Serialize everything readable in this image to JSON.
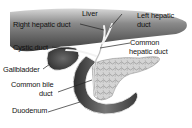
{
  "diagram": {
    "labels": {
      "liver": "Liver",
      "right_hepatic_duct": "Right hepatic duct",
      "left_hepatic_duct_line1": "Left hepatic",
      "left_hepatic_duct_line2": "duct",
      "cystic_duct": "Cystic duct",
      "common_hepatic_duct_line1": "Common",
      "common_hepatic_duct_line2": "hepatic duct",
      "gallbladder": "Gallbladder",
      "common_bile_duct_line1": "Common bile",
      "common_bile_duct_line2": "duct",
      "duodenum": "Duodenum"
    },
    "structures": [
      "liver",
      "gallbladder",
      "duodenum",
      "pancreas",
      "hepatic ducts",
      "cystic duct",
      "common bile duct"
    ],
    "colors": {
      "liver_dark": "#3a3a3a",
      "liver_light": "#9a9a9a",
      "duct": "#f2f2f2",
      "pancreas": "#c8c8c8",
      "duodenum": "#5a5a5a"
    }
  }
}
